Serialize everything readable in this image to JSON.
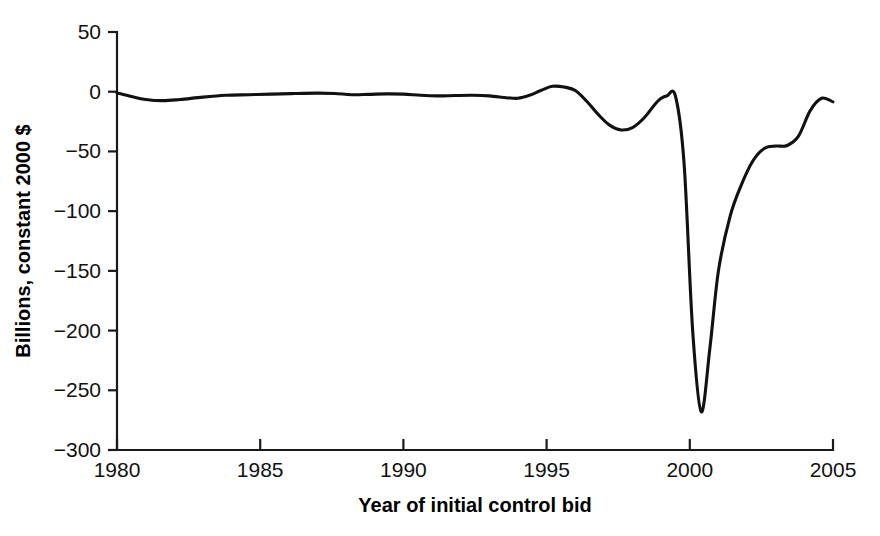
{
  "chart_data": {
    "type": "line",
    "title": "",
    "subtitle": "",
    "xlabel": "Year of initial control bid",
    "ylabel": "Billions, constant 2000 $",
    "xlim": [
      1980,
      2005
    ],
    "ylim": [
      -300,
      50
    ],
    "xticks": [
      1980,
      1985,
      1990,
      1995,
      2000,
      2005
    ],
    "xtick_labels": [
      "1980",
      "1985",
      "1990",
      "1995",
      "2000",
      "2005"
    ],
    "yticks": [
      50,
      0,
      -50,
      -100,
      -150,
      -200,
      -250,
      -300
    ],
    "ytick_labels": [
      "50",
      "0",
      "−50",
      "−100",
      "−150",
      "−200",
      "−250",
      "−300"
    ],
    "grid": false,
    "legend": false,
    "legend_position": "none",
    "series": [
      {
        "name": "Aggregate dollar value gained or lost",
        "color": "#111111",
        "x": [
          1980.0,
          1980.5,
          1981.0,
          1981.6,
          1982.2,
          1983.0,
          1983.8,
          1984.6,
          1985.4,
          1986.2,
          1987.0,
          1987.6,
          1988.2,
          1988.8,
          1989.4,
          1990.0,
          1990.6,
          1991.2,
          1991.8,
          1992.4,
          1993.0,
          1993.6,
          1994.0,
          1994.4,
          1994.8,
          1995.2,
          1995.6,
          1996.0,
          1996.4,
          1996.8,
          1997.2,
          1997.6,
          1998.0,
          1998.4,
          1998.8,
          1999.0,
          1999.2,
          1999.5,
          1999.8,
          2000.1,
          2000.4,
          2000.7,
          2001.0,
          2001.4,
          2001.8,
          2002.2,
          2002.6,
          2003.0,
          2003.4,
          2003.8,
          2004.2,
          2004.6,
          2005.0
        ],
        "y": [
          -1.0,
          -4.0,
          -6.5,
          -7.5,
          -6.5,
          -4.5,
          -3.0,
          -2.5,
          -2.0,
          -1.5,
          -1.2,
          -1.5,
          -2.5,
          -2.2,
          -1.8,
          -2.0,
          -3.0,
          -3.5,
          -3.2,
          -3.0,
          -3.5,
          -5.0,
          -5.5,
          -3.0,
          1.0,
          4.5,
          4.0,
          1.0,
          -8.0,
          -19.0,
          -28.0,
          -32.0,
          -30.0,
          -22.0,
          -10.0,
          -5.5,
          -3.5,
          -3.8,
          -60.0,
          -200.0,
          -268.0,
          -215.0,
          -150.0,
          -105.0,
          -78.0,
          -58.0,
          -47.5,
          -45.5,
          -45.0,
          -37.0,
          -16.0,
          -5.5,
          -8.5
        ]
      }
    ]
  },
  "axes": {
    "x_axis_name": "x-axis",
    "y_axis_name": "y-axis"
  }
}
